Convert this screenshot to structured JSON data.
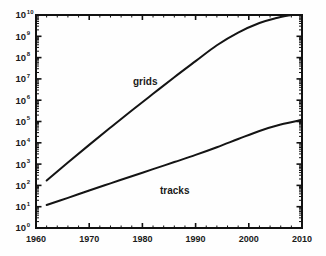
{
  "chart_data": {
    "type": "line",
    "title": "",
    "xlabel": "",
    "ylabel": "",
    "xlim": [
      1960,
      2010
    ],
    "ylim": [
      1,
      10000000000
    ],
    "yscale": "log",
    "xscale": "linear",
    "grid": false,
    "legend_position": "inline-annotations",
    "xticks": [
      1960,
      1970,
      1980,
      1990,
      2000,
      2010
    ],
    "xtick_labels": [
      "1960",
      "1970",
      "1980",
      "1990",
      "2000",
      "2010"
    ],
    "yticks": [
      1,
      10,
      100,
      1000,
      10000,
      100000,
      1000000,
      10000000,
      100000000,
      1000000000,
      10000000000
    ],
    "ytick_labels": [
      {
        "mantissa": "10",
        "exponent": "0"
      },
      {
        "mantissa": "10",
        "exponent": "1"
      },
      {
        "mantissa": "10",
        "exponent": "2"
      },
      {
        "mantissa": "10",
        "exponent": "3"
      },
      {
        "mantissa": "10",
        "exponent": "4"
      },
      {
        "mantissa": "10",
        "exponent": "5"
      },
      {
        "mantissa": "10",
        "exponent": "6"
      },
      {
        "mantissa": "10",
        "exponent": "7"
      },
      {
        "mantissa": "10",
        "exponent": "8"
      },
      {
        "mantissa": "10",
        "exponent": "9"
      },
      {
        "mantissa": "10",
        "exponent": "10"
      }
    ],
    "series": [
      {
        "name": "grids",
        "annotation": "grids",
        "color": "#141414",
        "x": [
          1962,
          1966,
          1970,
          1974,
          1978,
          1982,
          1986,
          1990,
          1994,
          1998,
          2002,
          2005,
          2008
        ],
        "y": [
          170,
          1200,
          8000,
          52000,
          330000,
          2000000,
          12000000,
          68000000,
          380000000,
          1500000000,
          4200000000,
          7000000000,
          10000000000
        ]
      },
      {
        "name": "tracks",
        "annotation": "tracks",
        "color": "#141414",
        "x": [
          1962,
          1966,
          1970,
          1974,
          1978,
          1982,
          1986,
          1990,
          1994,
          1998,
          2002,
          2006,
          2010
        ],
        "y": [
          12,
          26,
          58,
          125,
          270,
          580,
          1250,
          2700,
          6200,
          15000,
          36000,
          72000,
          120000
        ]
      }
    ]
  },
  "annotations": {
    "grids_label": "grids",
    "tracks_label": "tracks"
  },
  "colors": {
    "curve": "#141414",
    "axis": "#111111",
    "background": "#fefefe",
    "text": "#1a1a1a"
  }
}
